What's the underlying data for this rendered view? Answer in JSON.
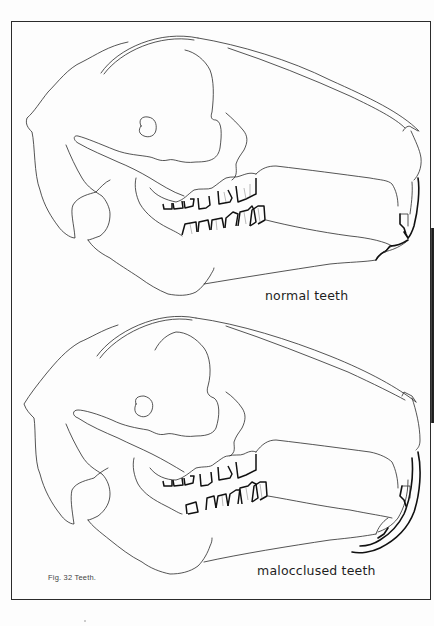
{
  "figure": {
    "caption": "Fig. 32  Teeth.",
    "panels": [
      {
        "id": "normal",
        "label": "normal teeth"
      },
      {
        "id": "maloccluded",
        "label": "malocclused teeth"
      }
    ]
  },
  "colors": {
    "paper": "#fdfdfd",
    "line": "#2a2a2a",
    "teeth_outline": "#111111",
    "frame": "#2b2b2b"
  }
}
